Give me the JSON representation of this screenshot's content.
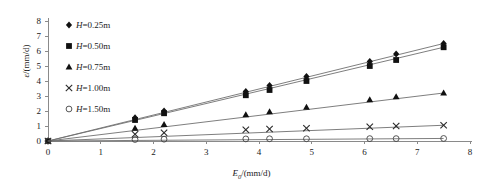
{
  "chart_data": {
    "type": "scatter",
    "title": "",
    "xlabel": "E₀/(mm/d)",
    "ylabel": "ε/(mm/d)",
    "xlim": [
      0,
      8
    ],
    "ylim": [
      0,
      8
    ],
    "xticks": [
      0,
      1,
      2,
      3,
      4,
      5,
      6,
      7,
      8
    ],
    "yticks": [
      0,
      1,
      2,
      3,
      4,
      5,
      6,
      7,
      8
    ],
    "xtick_labels": [
      "0",
      "1",
      "2",
      "3",
      "4",
      "5",
      "6",
      "7",
      "8"
    ],
    "ytick_labels": [
      "0",
      "1",
      "2",
      "3",
      "4",
      "5",
      "6",
      "7",
      "8"
    ],
    "grid": false,
    "legend_position": "upper-left",
    "x": [
      0,
      1.65,
      2.2,
      3.75,
      4.2,
      4.9,
      6.1,
      6.6,
      7.5
    ],
    "series": [
      {
        "name": "H=0.25m",
        "marker": "diamond",
        "values": [
          0,
          1.55,
          2.0,
          3.3,
          3.7,
          4.3,
          5.3,
          5.8,
          6.5
        ],
        "trend_end": 6.5
      },
      {
        "name": "H=0.50m",
        "marker": "square",
        "values": [
          0,
          1.4,
          1.85,
          3.05,
          3.4,
          4.0,
          5.0,
          5.4,
          6.25
        ],
        "trend_end": 6.25
      },
      {
        "name": "H=0.75m",
        "marker": "triangle",
        "values": [
          0,
          0.85,
          1.1,
          1.75,
          1.95,
          2.25,
          2.75,
          2.95,
          3.2
        ],
        "trend_end": 3.2
      },
      {
        "name": "H=1.00m",
        "marker": "cross",
        "values": [
          0,
          0.45,
          0.55,
          0.75,
          0.8,
          0.85,
          0.95,
          1.0,
          1.05
        ],
        "trend_end": 1.05
      },
      {
        "name": "H=1.50m",
        "marker": "circle",
        "values": [
          0,
          0.1,
          0.12,
          0.14,
          0.15,
          0.15,
          0.16,
          0.16,
          0.17
        ],
        "trend_end": 0.17
      }
    ]
  },
  "legend": {
    "items": [
      {
        "glyph": "diamond-marker-icon",
        "label": "H=0.25m",
        "symbol": "◆"
      },
      {
        "glyph": "square-marker-icon",
        "label": "H=0.50m",
        "symbol": "■"
      },
      {
        "glyph": "triangle-marker-icon",
        "label": "H=0.75m",
        "symbol": "▲"
      },
      {
        "glyph": "cross-marker-icon",
        "label": "H=1.00m",
        "symbol": "✕"
      },
      {
        "glyph": "circle-marker-icon",
        "label": "H=1.50m",
        "symbol": "○"
      }
    ]
  },
  "axes": {
    "x_title": "E₀/(mm/d)",
    "y_title": "ε/(mm/d)"
  }
}
